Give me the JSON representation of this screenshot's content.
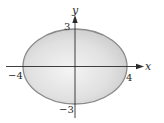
{
  "diagram": {
    "type": "ellipse-plot",
    "equation_implied": "x^2/16 + y^2/9 = 1",
    "center": [
      0,
      0
    ],
    "semi_axes": {
      "a": 4,
      "b": 3
    },
    "region": "interior shaded",
    "axes": {
      "x_label": "x",
      "y_label": "y"
    },
    "tick_labels": {
      "x_neg": "−4",
      "x_pos": "4",
      "y_pos": "3",
      "y_neg": "−3"
    },
    "colors": {
      "fill_light": "#f2f2f2",
      "fill_dark": "#c9c9c9",
      "outline": "#8a8a8a",
      "axis": "#2a2a2a",
      "text": "#2a2a2a"
    }
  }
}
